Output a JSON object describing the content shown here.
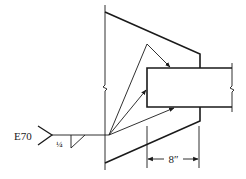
{
  "diagram": {
    "type": "welded-bracket-connection",
    "weld_symbol": {
      "electrode": "E70",
      "fillet_size": "¼",
      "weld_type": "fillet"
    },
    "dimension": {
      "label": "8″",
      "description": "length of weld overlap on plate"
    },
    "colors": {
      "line": "#1a1a1a",
      "background": "#ffffff"
    }
  }
}
